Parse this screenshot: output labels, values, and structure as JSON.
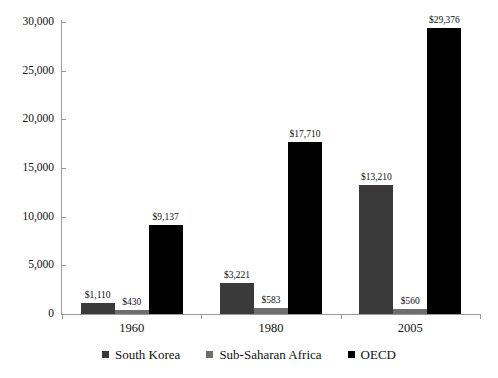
{
  "chart_data": {
    "type": "bar",
    "title": "",
    "subtitle": "",
    "xlabel": "",
    "ylabel": "",
    "categories": [
      "1960",
      "1980",
      "2005"
    ],
    "series": [
      {
        "name": "South Korea",
        "color": "#3a3a3a",
        "values": [
          1110,
          3221,
          13210
        ],
        "labels": [
          "$1,110",
          "$3,221",
          "$13,210"
        ]
      },
      {
        "name": "Sub-Saharan Africa",
        "color": "#6e6e6e",
        "values": [
          430,
          583,
          560
        ],
        "labels": [
          "$430",
          "$583",
          "$560"
        ]
      },
      {
        "name": "OECD",
        "color": "#000000",
        "values": [
          9137,
          17710,
          29376
        ],
        "labels": [
          "$9,137",
          "$17,710",
          "$29,376"
        ]
      }
    ],
    "ylim": [
      0,
      30000
    ],
    "ytick_values": [
      0,
      5000,
      10000,
      15000,
      20000,
      25000,
      30000
    ],
    "ytick_labels": [
      "0",
      "5,000",
      "10,000",
      "15,000",
      "20,000",
      "25,000",
      "30,000"
    ],
    "grid": false,
    "legend_position": "bottom"
  },
  "legend": {
    "items": [
      {
        "label": "South Korea",
        "color": "#3a3a3a"
      },
      {
        "label": "Sub-Saharan Africa",
        "color": "#6e6e6e"
      },
      {
        "label": "OECD",
        "color": "#000000"
      }
    ]
  },
  "axis": {
    "line_color": "#9a9a9a"
  }
}
